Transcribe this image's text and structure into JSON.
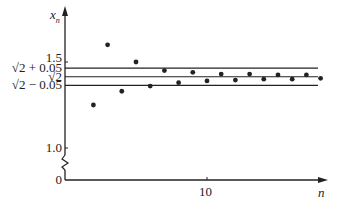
{
  "chart_data": {
    "type": "scatter",
    "title": "",
    "xlabel": "n",
    "ylabel": "x_n",
    "ylabel_main": "x",
    "ylabel_sub": "n",
    "x_ticks": [
      {
        "value": 10,
        "label": "10"
      }
    ],
    "y_ticks": [
      {
        "value": 0,
        "label": "0"
      },
      {
        "value": 1.0,
        "label": "1.0"
      },
      {
        "value": 1.5,
        "label": "1.5"
      }
    ],
    "y_axis_break": true,
    "reference_lines": [
      {
        "label": "√2 + 0.05",
        "value": 1.4642
      },
      {
        "label": "√2",
        "value": 1.4142
      },
      {
        "label": "√2 − 0.05",
        "value": 1.3642
      }
    ],
    "points": [
      {
        "n": 1,
        "x_n": 2.0
      },
      {
        "n": 2,
        "x_n": 1.25
      },
      {
        "n": 3,
        "x_n": 1.6
      },
      {
        "n": 4,
        "x_n": 1.33
      },
      {
        "n": 5,
        "x_n": 1.5
      },
      {
        "n": 6,
        "x_n": 1.36
      },
      {
        "n": 7,
        "x_n": 1.45
      },
      {
        "n": 8,
        "x_n": 1.38
      },
      {
        "n": 9,
        "x_n": 1.44
      },
      {
        "n": 10,
        "x_n": 1.39
      },
      {
        "n": 11,
        "x_n": 1.43
      },
      {
        "n": 12,
        "x_n": 1.395
      },
      {
        "n": 13,
        "x_n": 1.43
      },
      {
        "n": 14,
        "x_n": 1.4
      },
      {
        "n": 15,
        "x_n": 1.425
      },
      {
        "n": 16,
        "x_n": 1.4
      },
      {
        "n": 17,
        "x_n": 1.425
      },
      {
        "n": 18,
        "x_n": 1.405
      }
    ],
    "xlim": [
      0,
      20
    ],
    "ylim": [
      0,
      2.05
    ],
    "grid": false,
    "legend": null
  }
}
